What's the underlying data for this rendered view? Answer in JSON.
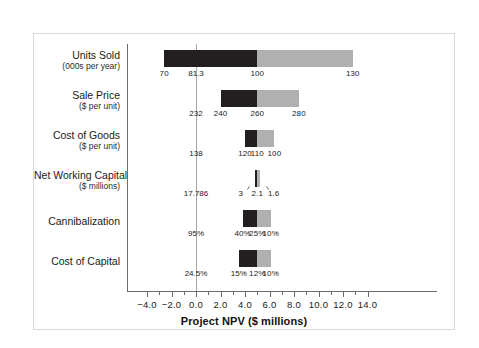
{
  "chart_data": {
    "type": "bar",
    "title": "",
    "xlabel": "Project NPV ($ millions)",
    "ylabel": "",
    "xlim": [
      -4.0,
      14.0
    ],
    "grid": false,
    "legend": null,
    "base_case_npv": 5.0,
    "axis_ticks": [
      {
        "value": -4.0,
        "label": "−4.0"
      },
      {
        "value": -2.0,
        "label": "−2.0"
      },
      {
        "value": 0.0,
        "label": "0.0"
      },
      {
        "value": 2.0,
        "label": "2.0"
      },
      {
        "value": 4.0,
        "label": "4.0"
      },
      {
        "value": 6.0,
        "label": "6.0"
      },
      {
        "value": 8.0,
        "label": "8.0"
      },
      {
        "value": 10.0,
        "label": "10.0"
      },
      {
        "value": 12.0,
        "label": "12.0"
      },
      {
        "value": 14.0,
        "label": "14.0"
      }
    ],
    "categories": [
      "Units Sold",
      "Sale Price",
      "Cost of Goods",
      "Net Working Capital",
      "Cannibalization",
      "Cost of Capital"
    ],
    "rows": [
      {
        "label": "Units Sold",
        "sublabel": "(000s per year)",
        "npv_low": -2.6,
        "npv_base": 5.0,
        "npv_high": 12.8,
        "driver_low_label": "70",
        "driver_base_label": "100",
        "driver_high_label": "130",
        "breakeven_label": "81.3",
        "breakeven_npv": 0.0,
        "labels_style": "inline"
      },
      {
        "label": "Sale Price",
        "sublabel": "($ per unit)",
        "npv_low": 2.0,
        "npv_base": 5.0,
        "npv_high": 8.4,
        "driver_low_label": "240",
        "driver_base_label": "260",
        "driver_high_label": "280",
        "breakeven_label": "232",
        "breakeven_npv": 0.0,
        "labels_style": "inline"
      },
      {
        "label": "Cost of Goods",
        "sublabel": "($ per unit)",
        "npv_low": 4.0,
        "npv_base": 5.0,
        "npv_high": 6.4,
        "driver_low_label": "120",
        "driver_base_label": "110",
        "driver_high_label": "100",
        "breakeven_label": "138",
        "breakeven_npv": 0.0,
        "labels_style": "inline"
      },
      {
        "label": "Net Working Capital",
        "sublabel": "($ millions)",
        "npv_low": 4.8,
        "npv_base": 5.0,
        "npv_high": 5.2,
        "driver_low_label": "3",
        "driver_base_label": "2.1",
        "driver_high_label": "1.6",
        "breakeven_label": "17.786",
        "breakeven_npv": 0.0,
        "labels_style": "leader"
      },
      {
        "label": "Cannibalization",
        "sublabel": "",
        "npv_low": 3.8,
        "npv_base": 5.0,
        "npv_high": 6.1,
        "driver_low_label": "40%",
        "driver_base_label": "25%",
        "driver_high_label": "10%",
        "breakeven_label": "95%",
        "breakeven_npv": 0.0,
        "labels_style": "inline"
      },
      {
        "label": "Cost of Capital",
        "sublabel": "",
        "npv_low": 3.5,
        "npv_base": 5.0,
        "npv_high": 6.1,
        "driver_low_label": "15%",
        "driver_base_label": "12%",
        "driver_high_label": "10%",
        "breakeven_label": "24.5%",
        "breakeven_npv": 0.0,
        "labels_style": "inline"
      }
    ],
    "colors": {
      "bar_low": "#231f20",
      "bar_high": "#b0b0b0",
      "axis": "#6e6e6e",
      "base_line": "#a8a8a8",
      "frame": "#d8d8d8",
      "text": "#1a1a1a",
      "background": "#ffffff"
    }
  }
}
